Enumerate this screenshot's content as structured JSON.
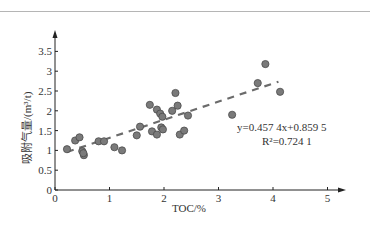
{
  "chart_data": {
    "type": "scatter",
    "title": "",
    "xlabel": "TOC/%",
    "ylabel": "吸附气量/(m³/t)",
    "xlim": [
      0,
      5
    ],
    "ylim": [
      0,
      3.5
    ],
    "x_ticks": [
      "0",
      "1",
      "2",
      "3",
      "4",
      "5"
    ],
    "y_ticks": [
      "0",
      "0.5",
      "1",
      "1.5",
      "2",
      "2.5",
      "3",
      "3.5"
    ],
    "grid": false,
    "legend": null,
    "series": [
      {
        "name": "samples",
        "marker": "circle",
        "color": "#7a7a7a",
        "points": [
          [
            0.22,
            1.03
          ],
          [
            0.37,
            1.25
          ],
          [
            0.45,
            1.33
          ],
          [
            0.5,
            0.98
          ],
          [
            0.53,
            0.88
          ],
          [
            0.52,
            0.93
          ],
          [
            0.8,
            1.23
          ],
          [
            0.9,
            1.23
          ],
          [
            1.09,
            1.08
          ],
          [
            1.23,
            1.0
          ],
          [
            1.5,
            1.38
          ],
          [
            1.56,
            1.6
          ],
          [
            1.74,
            2.15
          ],
          [
            1.78,
            1.48
          ],
          [
            1.87,
            2.03
          ],
          [
            1.87,
            1.4
          ],
          [
            1.93,
            1.93
          ],
          [
            1.97,
            1.85
          ],
          [
            1.95,
            1.58
          ],
          [
            1.98,
            1.53
          ],
          [
            2.15,
            2.0
          ],
          [
            2.21,
            2.45
          ],
          [
            2.25,
            2.13
          ],
          [
            2.29,
            1.4
          ],
          [
            2.37,
            1.5
          ],
          [
            2.44,
            1.88
          ],
          [
            3.25,
            1.9
          ],
          [
            3.72,
            2.7
          ],
          [
            3.86,
            3.18
          ],
          [
            4.13,
            2.48
          ]
        ]
      }
    ],
    "trendline": {
      "type": "linear",
      "slope": 0.4574,
      "intercept": 0.8595,
      "x_range": [
        0.22,
        4.1
      ],
      "style": "dashed",
      "color": "#6b6b6b"
    },
    "annotations": [
      {
        "text": "y=0.457 4x+0.859 5",
        "x": 3.4,
        "y": 1.55
      },
      {
        "text": "R²=0.724 1",
        "x": 3.6,
        "y": 1.3
      }
    ]
  },
  "labels": {
    "xlabel": "TOC/%",
    "ylabel": "吸附气量/(m³/t)",
    "equation": "y=0.457 4x+0.859 5",
    "r2": "R²=0.724 1"
  }
}
